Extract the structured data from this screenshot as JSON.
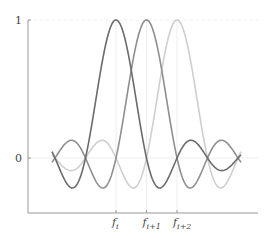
{
  "chart_data": {
    "type": "line",
    "title": "",
    "xlabel": "",
    "ylabel": "",
    "ylim": [
      -0.4,
      1.0
    ],
    "grid": false,
    "legend": "none",
    "y_ticks": [
      {
        "value": 1,
        "label": "1"
      },
      {
        "value": 0,
        "label": "0"
      }
    ],
    "x_ticks": [
      {
        "value": 0,
        "label": "f",
        "sub": "i"
      },
      {
        "value": 1,
        "label": "f",
        "sub": "i+1"
      },
      {
        "value": 2,
        "label": "f",
        "sub": "i+2"
      }
    ],
    "x_range": [
      -2.1,
      4.1
    ],
    "series": [
      {
        "name": "sinc centered at f_i",
        "center": 0,
        "color": "#6b6b6b",
        "function": "sin(pi(x-c))/(pi(x-c))"
      },
      {
        "name": "sinc centered at f_i+1",
        "center": 1,
        "color": "#8f8f8f",
        "function": "sin(pi(x-c))/(pi(x-c))"
      },
      {
        "name": "sinc centered at f_i+2",
        "center": 2,
        "color": "#cfcfcf",
        "function": "sin(pi(x-c))/(pi(x-c))"
      }
    ],
    "annotations": []
  },
  "layout": {
    "axis_color": "#999999",
    "guide_color": "#eeeeee"
  }
}
